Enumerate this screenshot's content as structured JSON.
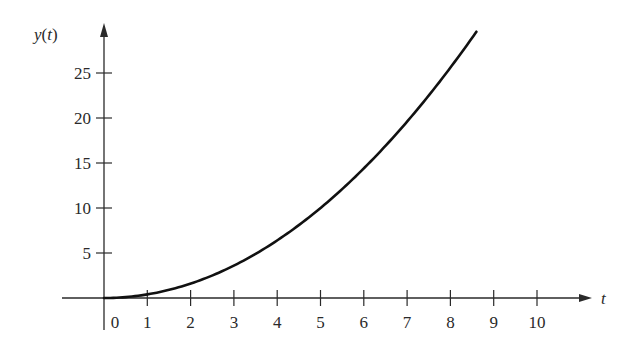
{
  "chart_data": {
    "type": "line",
    "title": "",
    "xlabel": "t",
    "ylabel": "y(t)",
    "x_ticks": [
      0,
      1,
      2,
      3,
      4,
      5,
      6,
      7,
      8,
      9,
      10
    ],
    "y_ticks": [
      5,
      10,
      15,
      20,
      25
    ],
    "xlim": [
      0,
      10
    ],
    "ylim": [
      0,
      29
    ],
    "grid": false,
    "legend": null,
    "series": [
      {
        "name": "y(t)",
        "x": [
          0,
          1,
          2,
          3,
          4,
          5,
          6,
          7,
          8,
          8.6
        ],
        "values": [
          0,
          0.4,
          1.6,
          3.6,
          6.4,
          10.0,
          14.4,
          19.6,
          25.6,
          29.6
        ]
      }
    ]
  },
  "axes": {
    "origin_px": [
      104,
      298
    ],
    "px_per_t": 43.3,
    "px_per_y": 9.0
  },
  "colors": {
    "axis": "#2a2a2a",
    "curve": "#111111"
  }
}
